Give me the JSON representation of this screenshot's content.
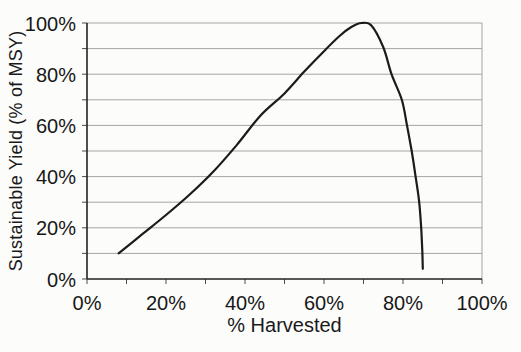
{
  "chart_data": {
    "type": "line",
    "title": "",
    "xlabel": "% Harvested",
    "ylabel": "Sustainable Yield (% of MSY)",
    "xlim": [
      0,
      100
    ],
    "ylim": [
      0,
      100
    ],
    "x_tick_values": [
      0,
      20,
      40,
      60,
      80,
      100
    ],
    "x_tick_labels": [
      "0%",
      "20%",
      "40%",
      "60%",
      "80%",
      "100%"
    ],
    "x_minor_tick_step": 10,
    "y_tick_values": [
      0,
      20,
      40,
      60,
      80,
      100
    ],
    "y_tick_labels": [
      "0%",
      "20%",
      "40%",
      "60%",
      "80%",
      "100%"
    ],
    "y_gridline_step": 10,
    "grid": "horizontal gridlines every 10%; plot area bordered on right; no vertical gridlines",
    "legend": "none",
    "series": [
      {
        "name": "sustainable-yield-curve",
        "points": [
          [
            8,
            10
          ],
          [
            14,
            17.5
          ],
          [
            20,
            25
          ],
          [
            26,
            33
          ],
          [
            32,
            42
          ],
          [
            38,
            52.5
          ],
          [
            44,
            64
          ],
          [
            50,
            72.5
          ],
          [
            55,
            81
          ],
          [
            60,
            89
          ],
          [
            64,
            95
          ],
          [
            67,
            98.5
          ],
          [
            69.5,
            100
          ],
          [
            72,
            99
          ],
          [
            75,
            90.5
          ],
          [
            77.1,
            80
          ],
          [
            79.7,
            70
          ],
          [
            81,
            60
          ],
          [
            82.2,
            50
          ],
          [
            83.2,
            40
          ],
          [
            84.1,
            30
          ],
          [
            84.6,
            20
          ],
          [
            84.9,
            10
          ],
          [
            85,
            4
          ]
        ]
      }
    ]
  },
  "colors": {
    "background": "#fcfcfa",
    "axis": "#222222",
    "gridline": "#a5a5a5",
    "tick": "#4a4a4a",
    "curve": "#1b1b1b",
    "text": "#171717"
  }
}
